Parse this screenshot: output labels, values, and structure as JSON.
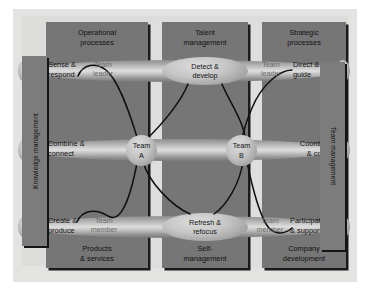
{
  "diagram": {
    "title_columns": [
      {
        "id": "operational",
        "line1": "Operational",
        "line2": "processes"
      },
      {
        "id": "talent",
        "line1": "Talent",
        "line2": "management"
      },
      {
        "id": "strategic",
        "line1": "Strategic",
        "line2": "processes"
      }
    ],
    "footer_columns": [
      {
        "id": "products",
        "line1": "Products",
        "line2": "& services"
      },
      {
        "id": "self",
        "line1": "Self-",
        "line2": "management"
      },
      {
        "id": "company",
        "line1": "Company",
        "line2": "development"
      }
    ],
    "side_labels": {
      "left": "Knowledge management",
      "right": "Team management"
    },
    "rows": [
      {
        "id": "top",
        "left": {
          "line1": "Sense &",
          "line2": "respond"
        },
        "center": {
          "line1": "Detect &",
          "line2": "develop"
        },
        "right": {
          "line1": "Direct &",
          "line2": "guide"
        },
        "role_left": {
          "line1": "Team",
          "line2": "leader"
        },
        "role_right": {
          "line1": "Team",
          "line2": "leader"
        }
      },
      {
        "id": "middle",
        "left": {
          "line1": "Combine &",
          "line2": "connect"
        },
        "center": {
          "line1": "",
          "line2": ""
        },
        "right": {
          "line1": "Coordinate",
          "line2": "& control"
        },
        "role_left": {
          "line1": "",
          "line2": ""
        },
        "role_right": {
          "line1": "",
          "line2": ""
        }
      },
      {
        "id": "bottom",
        "left": {
          "line1": "Create &",
          "line2": "produce"
        },
        "center": {
          "line1": "Refresh &",
          "line2": "refocus"
        },
        "right": {
          "line1": "Participate",
          "line2": "& support"
        },
        "role_left": {
          "line1": "Team",
          "line2": "member"
        },
        "role_right": {
          "line1": "Team",
          "line2": "member"
        }
      }
    ],
    "nodes": [
      {
        "id": "team-a",
        "line1": "Team",
        "line2": "A"
      },
      {
        "id": "team-b",
        "line1": "Team",
        "line2": "B"
      }
    ],
    "colors": {
      "panel": "#767676",
      "panel_shadow": "#1a1a1a",
      "sidebar": "#7c7c7c",
      "plate": "#e3e3e1",
      "plate_inner": "#dcdcda",
      "gap_light": "#dedede",
      "link": "#101010",
      "text": "#111111",
      "text_faint": "#6d6d6d"
    }
  }
}
